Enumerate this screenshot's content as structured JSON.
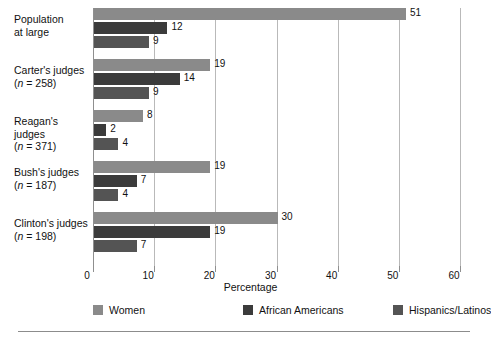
{
  "chart_data": {
    "type": "bar",
    "orientation": "horizontal",
    "title": "",
    "xlabel": "Percentage",
    "ylabel": "",
    "xlim": [
      0,
      60
    ],
    "xticks": [
      0,
      10,
      20,
      30,
      40,
      50,
      60
    ],
    "xtick_labels": [
      "0",
      "10",
      "20",
      "30",
      "40",
      "50",
      "60"
    ],
    "grid": "vertical",
    "legend_position": "bottom",
    "categories": [
      "Population at large",
      "Carter's judges (n = 258)",
      "Reagan's judges (n = 371)",
      "Bush's judges (n = 187)",
      "Clinton's judges (n = 198)"
    ],
    "series": [
      {
        "name": "Women",
        "color": "#8a8a8a",
        "values": [
          51,
          19,
          8,
          19,
          30
        ]
      },
      {
        "name": "African Americans",
        "color": "#3b3b3b",
        "values": [
          12,
          14,
          2,
          7,
          19
        ]
      },
      {
        "name": "Hispanics/Latinos",
        "color": "#545454",
        "values": [
          9,
          9,
          4,
          4,
          7
        ]
      }
    ]
  },
  "category_labels": [
    {
      "line1": "Population",
      "line2": "at large",
      "italic_n": ""
    },
    {
      "line1": "Carter's judges",
      "line2": "(n = 258)",
      "italic_n": "n"
    },
    {
      "line1": "Reagan's judges",
      "line2": "(n = 371)",
      "italic_n": "n"
    },
    {
      "line1": "Bush's judges",
      "line2": "(n = 187)",
      "italic_n": "n"
    },
    {
      "line1": "Clinton's judges",
      "line2": "(n = 198)",
      "italic_n": "n"
    }
  ],
  "axis": {
    "x_title": "Percentage"
  },
  "legend": {
    "items": [
      {
        "label": "Women",
        "color": "#8a8a8a"
      },
      {
        "label": "African Americans",
        "color": "#3b3b3b"
      },
      {
        "label": "Hispanics/Latinos",
        "color": "#545454"
      }
    ]
  },
  "colors": {
    "women": "#8a8a8a",
    "african_americans": "#3b3b3b",
    "hispanics_latinos": "#545454",
    "gridline": "#b9b9b9",
    "axis": "#8f8f8f",
    "text": "#111111",
    "background": "#ffffff"
  }
}
